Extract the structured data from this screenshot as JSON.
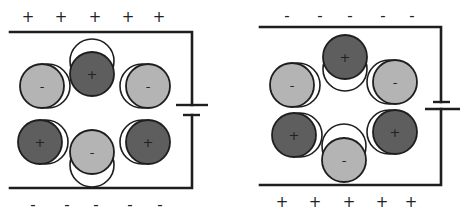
{
  "colors": {
    "negative_fill": "#b4b4b4",
    "positive_fill": "#5e5e5e",
    "wire": "#1e1e1e",
    "background": "#ffffff"
  },
  "panels": [
    {
      "name": "left",
      "top_charges": [
        {
          "x": 28,
          "y": 17,
          "sign": "+"
        },
        {
          "x": 61,
          "y": 17,
          "sign": "+"
        },
        {
          "x": 95,
          "y": 17,
          "sign": "+"
        },
        {
          "x": 128,
          "y": 17,
          "sign": "+"
        },
        {
          "x": 159,
          "y": 17,
          "sign": "+"
        }
      ],
      "bottom_charges": [
        {
          "x": 33,
          "y": 205,
          "sign": "-"
        },
        {
          "x": 67,
          "y": 205,
          "sign": "-"
        },
        {
          "x": 96,
          "y": 205,
          "sign": "-"
        },
        {
          "x": 130,
          "y": 205,
          "sign": "-"
        },
        {
          "x": 160,
          "y": 205,
          "sign": "-"
        }
      ],
      "balls": [
        {
          "cx": 42,
          "cy": 86,
          "gx": 48,
          "gy": 86,
          "sign": "-",
          "type": "negative"
        },
        {
          "cx": 92,
          "cy": 74,
          "gx": 92,
          "gy": 61,
          "sign": "+",
          "type": "positive"
        },
        {
          "cx": 148,
          "cy": 86,
          "gx": 142,
          "gy": 86,
          "sign": "-",
          "type": "negative"
        },
        {
          "cx": 40,
          "cy": 142,
          "gx": 46,
          "gy": 142,
          "sign": "+",
          "type": "positive"
        },
        {
          "cx": 92,
          "cy": 152,
          "gx": 92,
          "gy": 165,
          "sign": "-",
          "type": "negative"
        },
        {
          "cx": 148,
          "cy": 142,
          "gx": 142,
          "gy": 142,
          "sign": "+",
          "type": "positive"
        }
      ]
    },
    {
      "name": "right",
      "top_charges": [
        {
          "x": 287,
          "y": 16,
          "sign": "-"
        },
        {
          "x": 320,
          "y": 16,
          "sign": "-"
        },
        {
          "x": 350,
          "y": 16,
          "sign": "-"
        },
        {
          "x": 383,
          "y": 16,
          "sign": "-"
        },
        {
          "x": 412,
          "y": 16,
          "sign": "-"
        }
      ],
      "bottom_charges": [
        {
          "x": 282,
          "y": 202,
          "sign": "+"
        },
        {
          "x": 315,
          "y": 202,
          "sign": "+"
        },
        {
          "x": 349,
          "y": 202,
          "sign": "+"
        },
        {
          "x": 382,
          "y": 202,
          "sign": "+"
        },
        {
          "x": 411,
          "y": 202,
          "sign": "+"
        }
      ],
      "balls": [
        {
          "cx": 292,
          "cy": 85,
          "gx": 298,
          "gy": 85,
          "sign": "-",
          "type": "negative"
        },
        {
          "cx": 345,
          "cy": 57,
          "gx": 345,
          "gy": 69,
          "sign": "+",
          "type": "positive"
        },
        {
          "cx": 395,
          "cy": 82,
          "gx": 389,
          "gy": 82,
          "sign": "-",
          "type": "negative"
        },
        {
          "cx": 294,
          "cy": 135,
          "gx": 300,
          "gy": 135,
          "sign": "+",
          "type": "positive"
        },
        {
          "cx": 344,
          "cy": 160,
          "gx": 344,
          "gy": 146,
          "sign": "-",
          "type": "negative"
        },
        {
          "cx": 395,
          "cy": 132,
          "gx": 389,
          "gy": 132,
          "sign": "+",
          "type": "positive"
        }
      ]
    }
  ]
}
